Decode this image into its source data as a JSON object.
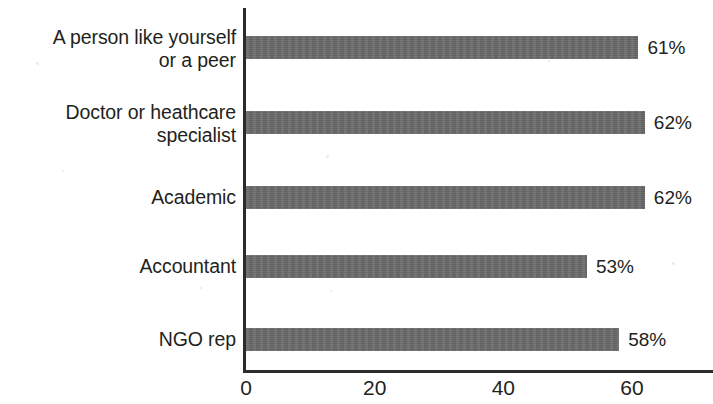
{
  "chart_data": {
    "type": "bar",
    "orientation": "horizontal",
    "title": "",
    "subtitle": "",
    "xlabel": "",
    "ylabel": "",
    "categories": [
      "A person like yourself\nor a peer",
      "Doctor or heathcare\nspecialist",
      "Academic",
      "Accountant",
      "NGO rep"
    ],
    "values": [
      61,
      62,
      62,
      53,
      58
    ],
    "value_labels": [
      "61%",
      "62%",
      "62%",
      "53%",
      "58%"
    ],
    "unit": "%",
    "xlim": [
      0,
      73
    ],
    "xticks": [
      0,
      20,
      40,
      60
    ],
    "xtick_labels": [
      "0",
      "20",
      "40",
      "60"
    ],
    "grid": false,
    "legend": false,
    "legend_position": "none",
    "bar_color": "#6a6a6a",
    "axis_color": "#2b2b2b",
    "text_color": "#231f20",
    "background_color": "#ffffff"
  }
}
